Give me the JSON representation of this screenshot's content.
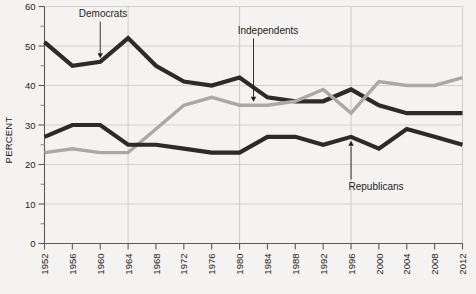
{
  "chart_data": {
    "type": "line",
    "title": "",
    "xlabel": "",
    "ylabel": "PERCENT",
    "ylim": [
      0,
      60
    ],
    "ytick_step": 10,
    "yticks": [
      0,
      10,
      20,
      30,
      40,
      50,
      60
    ],
    "yticks_minor_step": 5,
    "grid": "horizontal-and-vertical",
    "legend": "inline-annotations",
    "categories": [
      1952,
      1956,
      1960,
      1964,
      1968,
      1972,
      1976,
      1980,
      1984,
      1988,
      1992,
      1996,
      2000,
      2004,
      2008,
      2012
    ],
    "xtick_labels": [
      "1952",
      "1956",
      "1960",
      "1964",
      "1968",
      "1972",
      "1976",
      "1980",
      "1984",
      "1988",
      "1992",
      "1996",
      "2000",
      "2004",
      "2008",
      "2012"
    ],
    "xtick_rotation": 90,
    "series": [
      {
        "name": "Democrats",
        "color": "#2b2b2b",
        "values": [
          51,
          45,
          46,
          52,
          45,
          41,
          40,
          42,
          37,
          36,
          36,
          39,
          35,
          33,
          33,
          33
        ]
      },
      {
        "name": "Independents",
        "color": "#a9a9a7",
        "values": [
          23,
          24,
          23,
          23,
          29,
          35,
          37,
          35,
          35,
          36,
          39,
          33,
          41,
          40,
          40,
          42
        ]
      },
      {
        "name": "Republicans",
        "color": "#2b2b2b",
        "values": [
          27,
          30,
          30,
          25,
          25,
          24,
          23,
          23,
          27,
          27,
          25,
          27,
          24,
          29,
          27,
          25
        ]
      }
    ],
    "annotations": [
      {
        "text": "Democrats",
        "target_year": 1960,
        "target_value": 46
      },
      {
        "text": "Independents",
        "target_year": 1982,
        "target_value": 35
      },
      {
        "text": "Republicans",
        "target_year": 1996,
        "target_value": 27
      }
    ]
  },
  "footer": {
    "caption": ""
  }
}
